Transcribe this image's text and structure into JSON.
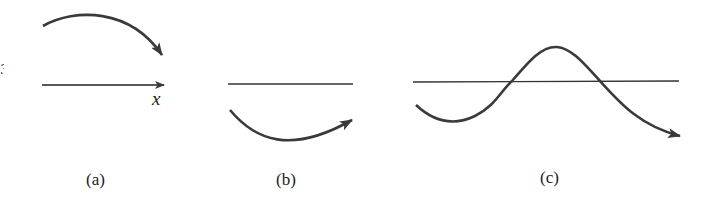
{
  "figure": {
    "panels": [
      {
        "id": "a",
        "label": "(a)",
        "axis_label": "x",
        "description": "downward-curving arc arrow above horizontal x-axis arrow"
      },
      {
        "id": "b",
        "label": "(b)",
        "description": "upward-curving arc arrow below horizontal line"
      },
      {
        "id": "c",
        "label": "(c)",
        "description": "wave curve crossing horizontal line, ending in arrow"
      }
    ],
    "edge_fragment": "3",
    "colors": {
      "stroke": "#3a3a3a",
      "text": "#222222"
    }
  }
}
